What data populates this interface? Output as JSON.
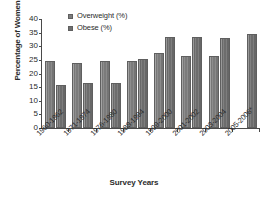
{
  "chart_data": {
    "type": "bar",
    "title": "",
    "xlabel": "Survey Years",
    "ylabel": "Percentage of Women",
    "categories": [
      "1960-1962",
      "1971-1974",
      "1976-1980",
      "1988-1994",
      "1999-2000",
      "2001-2002",
      "2003-2004",
      "2005-2006*"
    ],
    "series": [
      {
        "name": "Overweight (%)",
        "color": "#7d7d7d",
        "values": [
          24.5,
          24.0,
          24.5,
          24.5,
          27.4,
          26.5,
          26.6,
          null
        ]
      },
      {
        "name": "Obese (%)",
        "color": "#6f6f6f",
        "values": [
          15.7,
          16.4,
          16.6,
          25.3,
          33.4,
          33.4,
          33.2,
          34.5
        ]
      }
    ],
    "ylim": [
      0,
      40
    ],
    "yticks": [
      0,
      5,
      10,
      15,
      20,
      25,
      30,
      35,
      40
    ],
    "ytick_labels": [
      "0",
      "5",
      "10",
      "15",
      "20",
      "25",
      "30",
      "35",
      "40"
    ],
    "grid": false,
    "legend_position": "top-left",
    "legend": [
      "Overweight (%)",
      "Obese (%)"
    ]
  },
  "axes": {
    "y_title": "Percentage of Women",
    "x_title": "Survey Years"
  }
}
